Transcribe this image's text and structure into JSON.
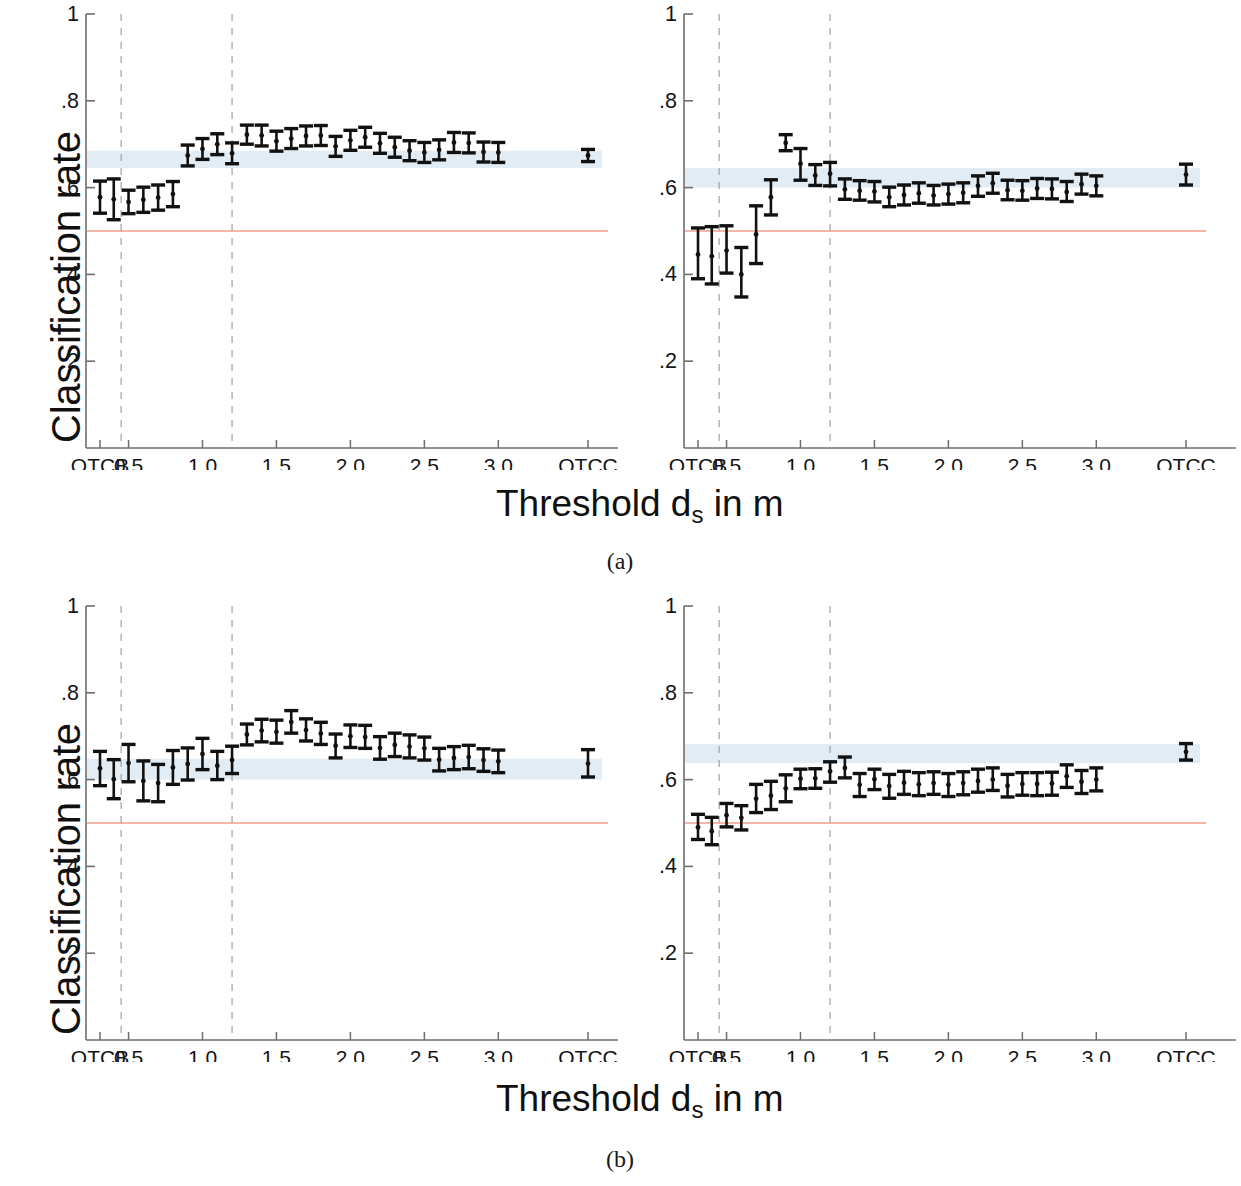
{
  "figure": {
    "axis_label_y": "Classification rate",
    "axis_label_x_text": "Threshold d",
    "axis_label_x_sub": "s",
    "axis_label_x_tail": " in m",
    "caption_a": "(a)",
    "caption_b": "(b)",
    "colors": {
      "data": "#111111",
      "baseline_line": "#f0a08a",
      "reference_band": "#dce9f2",
      "guide_dashed": "#a8a8a8",
      "axis": "#6e6e6e",
      "text": "#141414"
    }
  },
  "chart_data": [
    {
      "id": "panel-a-left",
      "type": "scatter",
      "title": "",
      "xlabel": "Threshold d_s in m",
      "ylabel": "Classification rate",
      "ylim": [
        0,
        1
      ],
      "ytick_values": [
        0.2,
        0.4,
        0.6,
        0.8,
        1
      ],
      "ytick_labels": [
        "0.2",
        "0.4",
        "0.6",
        "0.8",
        "1"
      ],
      "xtick_labels": [
        "QTCB",
        "0.5",
        "1.0",
        "1.5",
        "2.0",
        "2.5",
        "3.0",
        "QTCC"
      ],
      "grid": false,
      "legend": "none",
      "baseline_y": 0.5,
      "reference_band": [
        0.645,
        0.685
      ],
      "guide_lines_x": [
        0.45,
        1.2
      ],
      "categories": [
        "QTCB",
        0.4,
        0.5,
        0.6,
        0.7,
        0.8,
        0.9,
        1.0,
        1.1,
        1.2,
        1.3,
        1.4,
        1.5,
        1.6,
        1.7,
        1.8,
        1.9,
        2.0,
        2.1,
        2.2,
        2.3,
        2.4,
        2.5,
        2.6,
        2.7,
        2.8,
        2.9,
        3.0,
        "QTCC"
      ],
      "values": [
        0.578,
        0.573,
        0.567,
        0.572,
        0.577,
        0.585,
        0.674,
        0.689,
        0.7,
        0.679,
        0.722,
        0.72,
        0.707,
        0.713,
        0.719,
        0.72,
        0.695,
        0.709,
        0.716,
        0.702,
        0.693,
        0.685,
        0.681,
        0.687,
        0.704,
        0.703,
        0.682,
        0.681,
        0.674
      ],
      "err_low": [
        0.541,
        0.526,
        0.54,
        0.543,
        0.548,
        0.556,
        0.65,
        0.665,
        0.676,
        0.655,
        0.7,
        0.696,
        0.684,
        0.69,
        0.696,
        0.697,
        0.672,
        0.686,
        0.693,
        0.679,
        0.67,
        0.662,
        0.658,
        0.664,
        0.681,
        0.68,
        0.659,
        0.658,
        0.66
      ],
      "err_high": [
        0.615,
        0.62,
        0.594,
        0.601,
        0.606,
        0.614,
        0.698,
        0.713,
        0.724,
        0.703,
        0.744,
        0.744,
        0.73,
        0.736,
        0.742,
        0.743,
        0.718,
        0.732,
        0.739,
        0.725,
        0.716,
        0.708,
        0.704,
        0.71,
        0.727,
        0.726,
        0.705,
        0.704,
        0.688
      ]
    },
    {
      "id": "panel-a-right",
      "type": "scatter",
      "title": "",
      "xlabel": "Threshold d_s in m",
      "ylabel": "Classification rate",
      "ylim": [
        0,
        1
      ],
      "ytick_values": [
        0.2,
        0.4,
        0.6,
        0.8,
        1
      ],
      "ytick_labels": [
        "0.2",
        "0.4",
        "0.6",
        "0.8",
        "1"
      ],
      "xtick_labels": [
        "QTCB",
        "0.5",
        "1.0",
        "1.5",
        "2.0",
        "2.5",
        "3.0",
        "QTCC"
      ],
      "grid": false,
      "legend": "none",
      "baseline_y": 0.5,
      "reference_band": [
        0.6,
        0.645
      ],
      "guide_lines_x": [
        0.45,
        1.2
      ],
      "categories": [
        "QTCB",
        0.4,
        0.5,
        0.6,
        0.7,
        0.8,
        0.9,
        1.0,
        1.1,
        1.2,
        1.3,
        1.4,
        1.5,
        1.6,
        1.7,
        1.8,
        1.9,
        2.0,
        2.1,
        2.2,
        2.3,
        2.4,
        2.5,
        2.6,
        2.7,
        2.8,
        2.9,
        3.0,
        "QTCC"
      ],
      "values": [
        0.446,
        0.442,
        0.455,
        0.4,
        0.492,
        0.578,
        0.703,
        0.655,
        0.628,
        0.632,
        0.596,
        0.593,
        0.591,
        0.578,
        0.583,
        0.587,
        0.582,
        0.585,
        0.588,
        0.604,
        0.61,
        0.594,
        0.593,
        0.598,
        0.597,
        0.59,
        0.608,
        0.604,
        0.63
      ],
      "err_low": [
        0.39,
        0.378,
        0.403,
        0.348,
        0.425,
        0.537,
        0.685,
        0.617,
        0.605,
        0.604,
        0.573,
        0.571,
        0.567,
        0.556,
        0.56,
        0.564,
        0.56,
        0.562,
        0.565,
        0.58,
        0.587,
        0.572,
        0.571,
        0.575,
        0.574,
        0.568,
        0.585,
        0.581,
        0.606
      ],
      "err_high": [
        0.507,
        0.51,
        0.512,
        0.462,
        0.558,
        0.618,
        0.722,
        0.69,
        0.653,
        0.658,
        0.62,
        0.616,
        0.614,
        0.601,
        0.606,
        0.611,
        0.605,
        0.608,
        0.611,
        0.627,
        0.633,
        0.617,
        0.616,
        0.621,
        0.62,
        0.614,
        0.631,
        0.627,
        0.654
      ]
    },
    {
      "id": "panel-b-left",
      "type": "scatter",
      "title": "",
      "xlabel": "Threshold d_s in m",
      "ylabel": "Classification rate",
      "ylim": [
        0,
        1
      ],
      "ytick_values": [
        0.2,
        0.4,
        0.6,
        0.8,
        1
      ],
      "ytick_labels": [
        "0.2",
        "0.4",
        "0.6",
        "0.8",
        "1"
      ],
      "xtick_labels": [
        "QTCB",
        "0.5",
        "1.0",
        "1.5",
        "2.0",
        "2.5",
        "3.0",
        "QTCC"
      ],
      "grid": false,
      "legend": "none",
      "baseline_y": 0.5,
      "reference_band": [
        0.6,
        0.648
      ],
      "guide_lines_x": [
        0.45,
        1.2
      ],
      "categories": [
        "QTCB",
        0.4,
        0.5,
        0.6,
        0.7,
        0.8,
        0.9,
        1.0,
        1.1,
        1.2,
        1.3,
        1.4,
        1.5,
        1.6,
        1.7,
        1.8,
        1.9,
        2.0,
        2.1,
        2.2,
        2.3,
        2.4,
        2.5,
        2.6,
        2.7,
        2.8,
        2.9,
        3.0,
        "QTCC"
      ],
      "values": [
        0.626,
        0.601,
        0.638,
        0.597,
        0.592,
        0.628,
        0.636,
        0.659,
        0.632,
        0.645,
        0.704,
        0.713,
        0.71,
        0.733,
        0.714,
        0.706,
        0.678,
        0.7,
        0.698,
        0.673,
        0.68,
        0.676,
        0.672,
        0.646,
        0.65,
        0.652,
        0.645,
        0.642,
        0.637
      ],
      "err_low": [
        0.586,
        0.556,
        0.595,
        0.551,
        0.549,
        0.589,
        0.599,
        0.623,
        0.6,
        0.614,
        0.68,
        0.687,
        0.684,
        0.707,
        0.689,
        0.681,
        0.65,
        0.674,
        0.672,
        0.647,
        0.653,
        0.65,
        0.645,
        0.62,
        0.623,
        0.625,
        0.619,
        0.616,
        0.606
      ],
      "err_high": [
        0.665,
        0.646,
        0.681,
        0.643,
        0.635,
        0.667,
        0.673,
        0.695,
        0.665,
        0.677,
        0.728,
        0.739,
        0.737,
        0.759,
        0.74,
        0.732,
        0.705,
        0.726,
        0.725,
        0.699,
        0.707,
        0.703,
        0.698,
        0.672,
        0.676,
        0.679,
        0.671,
        0.668,
        0.669
      ]
    },
    {
      "id": "panel-b-right",
      "type": "scatter",
      "title": "",
      "xlabel": "Threshold d_s in m",
      "ylabel": "Classification rate",
      "ylim": [
        0,
        1
      ],
      "ytick_values": [
        0.2,
        0.4,
        0.6,
        0.8,
        1
      ],
      "ytick_labels": [
        "0.2",
        "0.4",
        "0.6",
        "0.8",
        "1"
      ],
      "xtick_labels": [
        "QTCB",
        "0.5",
        "1.0",
        "1.5",
        "2.0",
        "2.5",
        "3.0",
        "QTCC"
      ],
      "grid": false,
      "legend": "none",
      "baseline_y": 0.5,
      "reference_band": [
        0.638,
        0.682
      ],
      "guide_lines_x": [
        0.45,
        1.2
      ],
      "categories": [
        "QTCB",
        0.4,
        0.5,
        0.6,
        0.7,
        0.8,
        0.9,
        1.0,
        1.1,
        1.2,
        1.3,
        1.4,
        1.5,
        1.6,
        1.7,
        1.8,
        1.9,
        2.0,
        2.1,
        2.2,
        2.3,
        2.4,
        2.5,
        2.6,
        2.7,
        2.8,
        2.9,
        3.0,
        "QTCC"
      ],
      "values": [
        0.49,
        0.481,
        0.518,
        0.512,
        0.556,
        0.563,
        0.58,
        0.602,
        0.603,
        0.619,
        0.627,
        0.588,
        0.601,
        0.585,
        0.593,
        0.589,
        0.592,
        0.588,
        0.592,
        0.597,
        0.6,
        0.586,
        0.59,
        0.59,
        0.591,
        0.608,
        0.595,
        0.6,
        0.664
      ],
      "err_low": [
        0.462,
        0.45,
        0.491,
        0.484,
        0.524,
        0.531,
        0.549,
        0.579,
        0.58,
        0.594,
        0.604,
        0.561,
        0.577,
        0.557,
        0.566,
        0.563,
        0.566,
        0.561,
        0.565,
        0.571,
        0.575,
        0.56,
        0.564,
        0.563,
        0.564,
        0.582,
        0.568,
        0.574,
        0.645
      ],
      "err_high": [
        0.52,
        0.513,
        0.545,
        0.54,
        0.589,
        0.596,
        0.611,
        0.624,
        0.625,
        0.641,
        0.652,
        0.614,
        0.624,
        0.612,
        0.619,
        0.616,
        0.618,
        0.614,
        0.618,
        0.624,
        0.627,
        0.612,
        0.616,
        0.616,
        0.617,
        0.634,
        0.621,
        0.627,
        0.683
      ]
    }
  ]
}
